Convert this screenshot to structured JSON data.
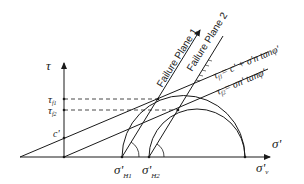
{
  "diagram": {
    "axes": {
      "y_label": "τ",
      "x_label": "σ'"
    },
    "y_ticks": {
      "tau_f1": "τ",
      "tau_f1_sub": "f1",
      "tau_f2": "τ",
      "tau_f2_sub": "f2",
      "cohesion": "c'"
    },
    "x_ticks": {
      "sigma_h1": "σ'",
      "sigma_h1_sub": "H1",
      "sigma_h2": "σ'",
      "sigma_h2_sub": "H2",
      "sigma_v": "σ'",
      "sigma_v_sub": "v"
    },
    "failure_planes": {
      "plane1": "Failure Plane 1",
      "plane2": "Failure Plane 2"
    },
    "envelopes": {
      "envelope1_lhs": "τ",
      "envelope1_sub": "f1",
      "envelope1_rhs": "= c' + σ'n tanφ'",
      "envelope2_lhs": "τ",
      "envelope2_sub": "f2",
      "envelope2_rhs": "= σn' tanφ'"
    },
    "colors": {
      "line": "#1a1a1a",
      "background": "#ffffff"
    }
  }
}
